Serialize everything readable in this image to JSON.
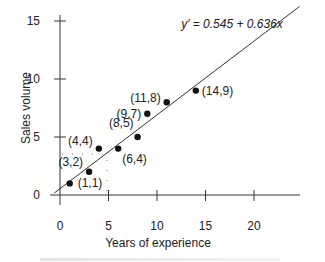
{
  "chart_data": {
    "type": "scatter",
    "title": "",
    "xlabel": "Years of experience",
    "ylabel": "Sales volume",
    "xlim": [
      0,
      25
    ],
    "ylim": [
      0,
      16
    ],
    "x_ticks": [
      0,
      5,
      10,
      15,
      20
    ],
    "y_ticks": [
      0,
      5,
      10,
      15
    ],
    "grid": false,
    "points": [
      {
        "x": 1,
        "y": 1,
        "label": "(1,1)"
      },
      {
        "x": 3,
        "y": 2,
        "label": "(3,2)"
      },
      {
        "x": 4,
        "y": 4,
        "label": "(4,4)"
      },
      {
        "x": 6,
        "y": 4,
        "label": "(6,4)"
      },
      {
        "x": 8,
        "y": 5,
        "label": "(8,5)"
      },
      {
        "x": 9,
        "y": 7,
        "label": "(9,7)"
      },
      {
        "x": 11,
        "y": 8,
        "label": "(11,8)"
      },
      {
        "x": 14,
        "y": 9,
        "label": "(14,9)"
      }
    ],
    "regression_line": {
      "intercept": 0.545,
      "slope": 0.636,
      "equation": "y′ = 0.545 + 0.636x"
    },
    "annotations": [
      "y′ = 0.545 + 0.636x"
    ]
  }
}
